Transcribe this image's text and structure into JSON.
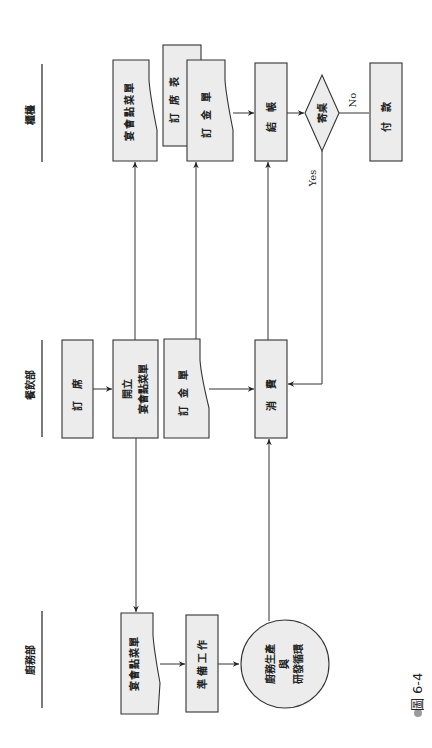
{
  "figure": {
    "caption": "圖 6-4",
    "orientation": "rotated 90° counter-clockwise"
  },
  "lanes": [
    {
      "id": "counter",
      "label": "櫃檯"
    },
    {
      "id": "dining",
      "label": "餐飲部"
    },
    {
      "id": "kitchen",
      "label": "廚務部"
    }
  ],
  "nodes": {
    "counter_menu_doc": {
      "label": "宴會點菜單",
      "shape": "document",
      "lane": "counter"
    },
    "counter_reservation_table": {
      "label": "訂席表",
      "shape": "rectangle",
      "lane": "counter"
    },
    "counter_deposit_doc": {
      "label": "訂金單",
      "shape": "document",
      "lane": "counter"
    },
    "checkout": {
      "label": "結帳",
      "shape": "rectangle",
      "lane": "counter"
    },
    "charge_to_account": {
      "label": "寄桌",
      "shape": "diamond",
      "lane": "counter"
    },
    "payment": {
      "label": "付款",
      "shape": "rectangle",
      "lane": "counter"
    },
    "reservation": {
      "label": "訂席",
      "shape": "rectangle",
      "lane": "dining"
    },
    "issue_menu": {
      "label_line1": "開立",
      "label_line2": "宴會點菜單",
      "shape": "rectangle",
      "lane": "dining"
    },
    "dining_deposit_doc": {
      "label": "訂金單",
      "shape": "document",
      "lane": "dining"
    },
    "consumption": {
      "label": "消費",
      "shape": "rectangle",
      "lane": "dining"
    },
    "kitchen_menu_doc": {
      "label": "宴會點菜單",
      "shape": "document",
      "lane": "kitchen"
    },
    "preparation": {
      "label": "準備工作",
      "shape": "rectangle",
      "lane": "kitchen"
    },
    "kitchen_cycle": {
      "label_line1": "廚務生產",
      "label_line2": "與",
      "label_line3": "研發循環",
      "shape": "circle",
      "lane": "kitchen"
    }
  },
  "edge_labels": {
    "yes": "Yes",
    "no": "No"
  },
  "edges": [
    {
      "from": "reservation",
      "to": "issue_menu"
    },
    {
      "from": "issue_menu",
      "to": "counter_menu_doc"
    },
    {
      "from": "issue_menu",
      "to": "kitchen_menu_doc"
    },
    {
      "from": "dining_deposit_doc",
      "to": "counter_deposit_doc"
    },
    {
      "from": "dining_deposit_doc",
      "to": "consumption"
    },
    {
      "from": "kitchen_menu_doc",
      "to": "preparation"
    },
    {
      "from": "preparation",
      "to": "kitchen_cycle"
    },
    {
      "from": "kitchen_cycle",
      "to": "consumption"
    },
    {
      "from": "consumption",
      "to": "checkout"
    },
    {
      "from": "counter_deposit_doc",
      "to": "checkout"
    },
    {
      "from": "checkout",
      "to": "charge_to_account"
    },
    {
      "from": "charge_to_account",
      "to": "payment",
      "label": "No"
    },
    {
      "from": "charge_to_account",
      "to": "consumption",
      "label": "Yes"
    }
  ]
}
